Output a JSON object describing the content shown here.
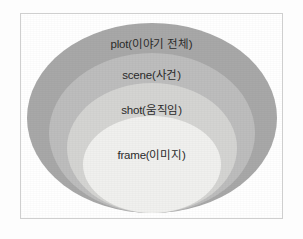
{
  "figure": {
    "type": "nested-ellipse-hierarchy",
    "frame": {
      "border_color": "#cfcfcf",
      "background_color": "#ffffff"
    },
    "levels": [
      {
        "id": "plot",
        "label": "plot(이야기 전체)",
        "term": "plot",
        "gloss": "이야기 전체",
        "depth": 1,
        "fill_color": "#a8a8a8"
      },
      {
        "id": "scene",
        "label": "scene(사건)",
        "term": "scene",
        "gloss": "사건",
        "depth": 2,
        "fill_color": "#bdbdbd"
      },
      {
        "id": "shot",
        "label": "shot(움직임)",
        "term": "shot",
        "gloss": "움직임",
        "depth": 3,
        "fill_color": "#d4d4d2"
      },
      {
        "id": "frame",
        "label": "frame(이미지)",
        "term": "frame",
        "gloss": "이미지",
        "depth": 4,
        "fill_color": "#f0f0ee"
      }
    ],
    "text_color": "#2b2b2b"
  }
}
